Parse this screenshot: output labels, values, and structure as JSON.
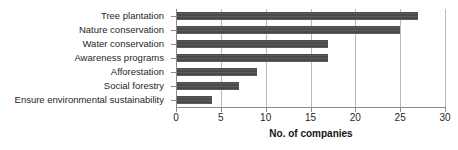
{
  "chart_data": {
    "type": "bar",
    "orientation": "horizontal",
    "title": "",
    "subtitle": "",
    "xlabel": "No. of companies",
    "ylabel": "",
    "categories": [
      "Tree plantation",
      "Nature conservation",
      "Water conservation",
      "Awareness programs",
      "Afforestation",
      "Social forestry",
      "Ensure environmental sustainability"
    ],
    "values": [
      27,
      25,
      17,
      17,
      9,
      7,
      4
    ],
    "xlim": [
      0,
      30
    ],
    "xticks": [
      0,
      5,
      10,
      15,
      20,
      25,
      30
    ],
    "xtick_labels": [
      "0",
      "5",
      "10",
      "15",
      "20",
      "25",
      "30"
    ],
    "grid": "vertical",
    "legend": "none",
    "bar_color": "#4a4a4a",
    "gridline_color": "#b9b9b9",
    "axis_color": "#8a8a8a",
    "text_color": "#1f1f1f"
  }
}
